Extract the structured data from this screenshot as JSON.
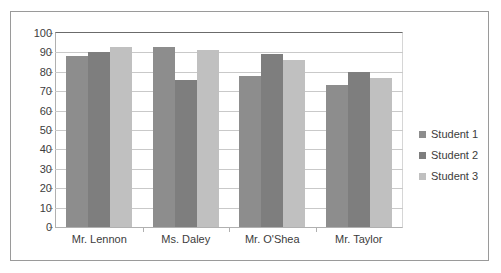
{
  "chart_data": {
    "type": "bar",
    "title": "",
    "subtitle": "",
    "xlabel": "",
    "ylabel": "",
    "grid": true,
    "legend_position": "right",
    "categories": [
      "Mr. Lennon",
      "Ms. Daley",
      "Mr. O'Shea",
      "Mr. Taylor"
    ],
    "series": [
      {
        "name": "Student 1",
        "color": "#8d8d8d",
        "values": [
          88,
          93,
          78,
          73
        ]
      },
      {
        "name": "Student 2",
        "color": "#7e7e7e",
        "values": [
          90,
          76,
          89,
          80
        ]
      },
      {
        "name": "Student 3",
        "color": "#c0c0c0",
        "values": [
          93,
          91,
          86,
          77
        ]
      }
    ],
    "ylim": [
      0,
      100
    ],
    "yticks": [
      0,
      10,
      20,
      30,
      40,
      50,
      60,
      70,
      80,
      90,
      100
    ],
    "ytick_labels": [
      "0",
      "10",
      "20",
      "30",
      "40",
      "50",
      "60",
      "70",
      "80",
      "90",
      "100"
    ]
  },
  "legend": {
    "entries": [
      {
        "label": "Student 1",
        "color": "#8d8d8d"
      },
      {
        "label": "Student 2",
        "color": "#7e7e7e"
      },
      {
        "label": "Student 3",
        "color": "#c0c0c0"
      }
    ]
  }
}
